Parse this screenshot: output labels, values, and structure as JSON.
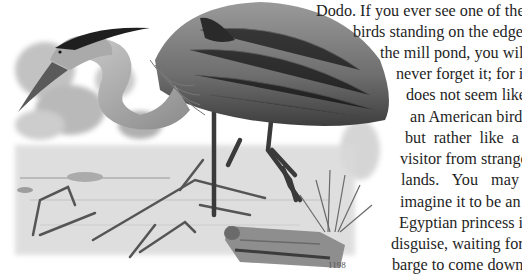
{
  "document": {
    "illustration": {
      "subject": "great blue heron wading in a pond",
      "caption_mark": "1198"
    },
    "lines": [
      {
        "text": "Dodo. If you ever see one of these",
        "left": 316,
        "top": 1
      },
      {
        "text": "birds standing on the edge of",
        "left": 353,
        "top": 22
      },
      {
        "text": "the mill pond, you will",
        "left": 380,
        "top": 43
      },
      {
        "text": "never forget it; for it",
        "left": 396,
        "top": 64
      },
      {
        "text": "does not seem like",
        "left": 406,
        "top": 85
      },
      {
        "text": "an American bird,",
        "left": 410,
        "top": 107
      },
      {
        "text": "but rather like a",
        "left": 405,
        "top": 128
      },
      {
        "text": "visitor from strange",
        "left": 400,
        "top": 149
      },
      {
        "text": "lands.  You  may",
        "left": 401,
        "top": 170
      },
      {
        "text": "imagine it to be an",
        "left": 400,
        "top": 192
      },
      {
        "text": "Egyptian princess in",
        "left": 399,
        "top": 213
      },
      {
        "text": "disguise, waiting for a",
        "left": 391,
        "top": 234
      },
      {
        "text": "barge to come down",
        "left": 392,
        "top": 255
      }
    ]
  }
}
